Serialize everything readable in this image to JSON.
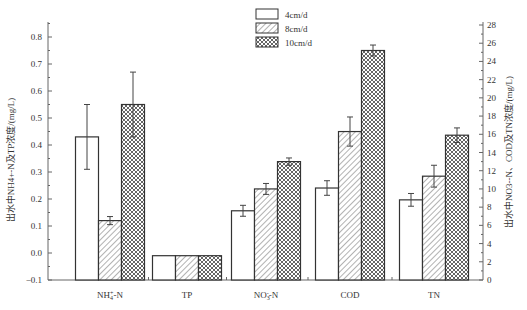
{
  "chart_data": {
    "type": "bar",
    "categories": [
      "NH4+-N",
      "TP",
      "NO3--N",
      "COD",
      "TN"
    ],
    "category_labels": [
      {
        "main": "NH",
        "sub": "4",
        "sup": "+",
        "rest": "-N"
      },
      {
        "main": "TP",
        "sub": "",
        "sup": "",
        "rest": ""
      },
      {
        "main": "NO",
        "sub": "3",
        "sup": "-",
        "rest": "-N"
      },
      {
        "main": "COD",
        "sub": "",
        "sup": "",
        "rest": ""
      },
      {
        "main": "TN",
        "sub": "",
        "sup": "",
        "rest": ""
      }
    ],
    "category_axis": [
      "left",
      "left",
      "right",
      "right",
      "right"
    ],
    "series": [
      {
        "name": "4cm/d",
        "pattern": "none",
        "values": [
          0.43,
          -0.01,
          7.6,
          10.1,
          8.8
        ],
        "errors": [
          0.12,
          0,
          0.6,
          0.8,
          0.7
        ]
      },
      {
        "name": "8cm/d",
        "pattern": "hatch",
        "values": [
          0.12,
          -0.01,
          10.0,
          16.3,
          11.4
        ],
        "errors": [
          0.015,
          0,
          0.6,
          1.6,
          1.2
        ]
      },
      {
        "name": "10cm/d",
        "pattern": "crosshatch",
        "values": [
          0.55,
          -0.01,
          13.0,
          25.2,
          15.9
        ],
        "errors": [
          0.12,
          0,
          0.4,
          0.6,
          0.8
        ]
      }
    ],
    "left_axis": {
      "label": "出水中NH4+-N及TP浓度/(mg/L)",
      "ylim": [
        -0.1,
        0.85
      ],
      "ticks": [
        -0.1,
        0.0,
        0.1,
        0.2,
        0.3,
        0.4,
        0.5,
        0.6,
        0.7,
        0.8
      ]
    },
    "right_axis": {
      "label": "出水中NO3--N、COD及TN浓度/(mg/L)",
      "ylim": [
        0,
        28
      ],
      "ticks": [
        0,
        2,
        4,
        6,
        8,
        10,
        12,
        14,
        16,
        18,
        20,
        22,
        24,
        26,
        28
      ]
    },
    "legend_position": "top-center",
    "grid": false
  }
}
